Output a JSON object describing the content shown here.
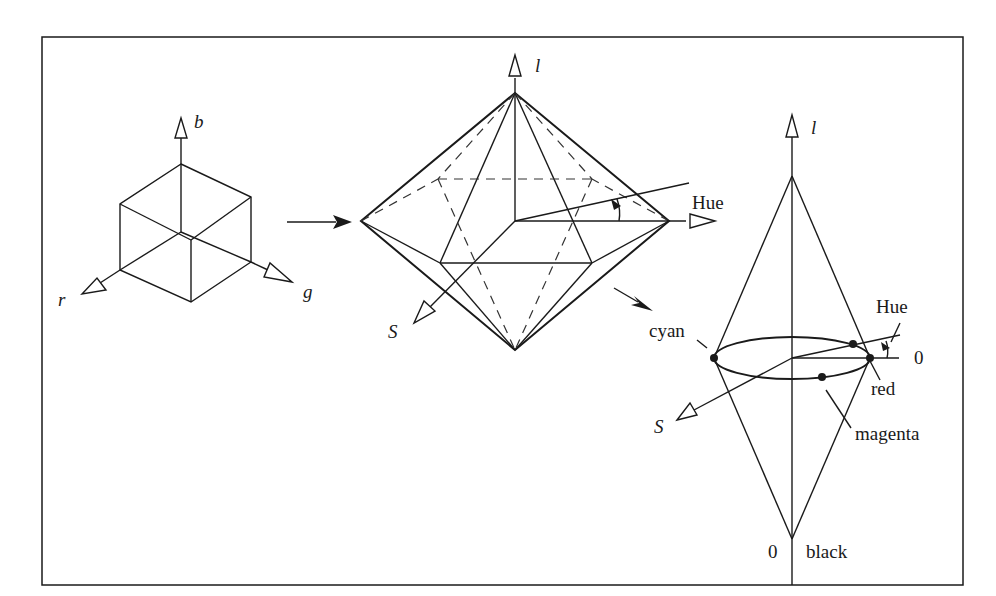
{
  "figure": {
    "frame": {
      "x": 42,
      "y": 37,
      "width": 921,
      "height": 548
    },
    "rgb_cube": {
      "axis_labels": {
        "blue": "b",
        "red": "r",
        "green": "g"
      }
    },
    "hexcone": {
      "axis_labels": {
        "lightness": "l",
        "saturation": "S",
        "hue": "Hue"
      }
    },
    "double_cone": {
      "axis_labels": {
        "lightness": "l",
        "saturation": "S",
        "hue": "Hue"
      },
      "annotations": {
        "cyan": "cyan",
        "red": "red",
        "magenta": "magenta",
        "zero_hue": "0",
        "zero_black": "0",
        "black": "black"
      }
    }
  }
}
